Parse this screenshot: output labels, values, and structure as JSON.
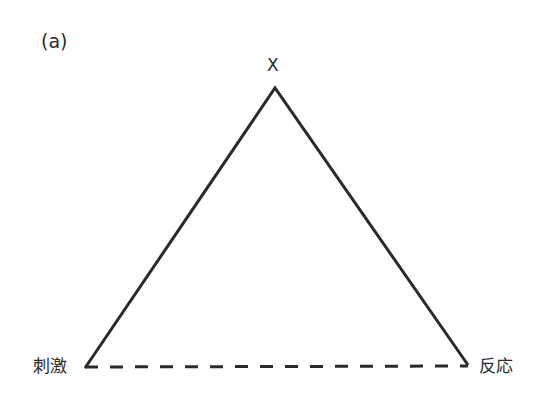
{
  "figure": {
    "panel_label": "(a)",
    "apex_label": "X",
    "left_label": "刺激",
    "right_label": "反応",
    "line_color": "#2a2a2a",
    "edges": [
      {
        "from": "刺激",
        "to": "X",
        "style": "solid"
      },
      {
        "from": "X",
        "to": "反応",
        "style": "solid"
      },
      {
        "from": "刺激",
        "to": "反応",
        "style": "dashed"
      }
    ]
  }
}
